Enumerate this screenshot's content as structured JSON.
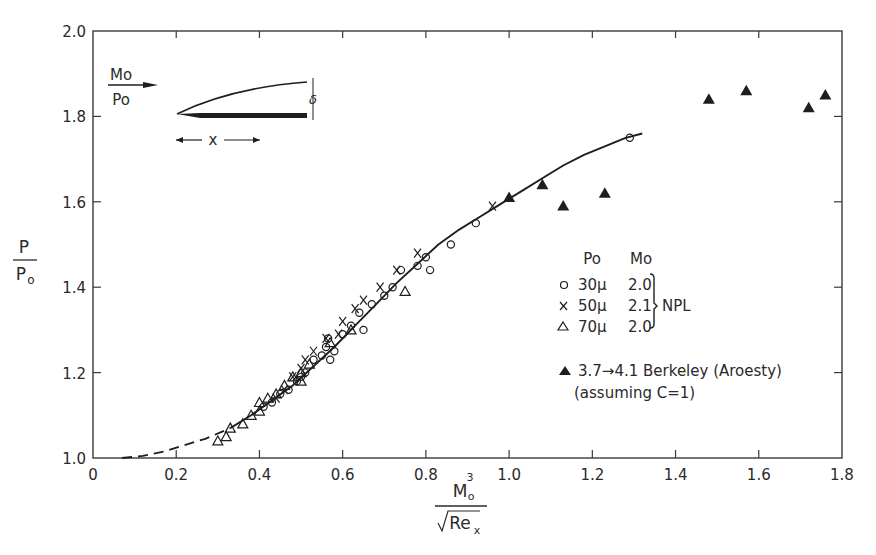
{
  "chart_data": {
    "type": "scatter",
    "title": "",
    "xlabel": "M_o^3 / sqrt(Re_x)",
    "ylabel": "P / P_o",
    "xlim": [
      0,
      1.8
    ],
    "ylim": [
      1.0,
      2.0
    ],
    "grid": false,
    "x_ticks": [
      "0",
      "0.2",
      "0.4",
      "0.6",
      "0.8",
      "1.0",
      "1.2",
      "1.4",
      "1.6",
      "1.8"
    ],
    "y_ticks": [
      "1.0",
      "1.2",
      "1.4",
      "1.6",
      "1.8",
      "2.0"
    ],
    "legend_position": "right-center inside plot",
    "legend": {
      "header_po": "Po",
      "header_mo": "Mo",
      "group_label": "NPL",
      "entries": [
        {
          "symbol": "open-circle",
          "po": "30μ",
          "mo": "2.0"
        },
        {
          "symbol": "cross",
          "po": "50μ",
          "mo": "2.1"
        },
        {
          "symbol": "open-triangle",
          "po": "70μ",
          "mo": "2.0"
        },
        {
          "symbol": "filled-triangle",
          "label": "3.7→4.1  Berkeley (Aroesty)",
          "note": "(assuming C=1)"
        }
      ]
    },
    "inset": {
      "flow_label_top": "Mo",
      "flow_label_bottom": "Po",
      "x_label": "x",
      "delta_label": "δ"
    },
    "curve": {
      "dashed": [
        [
          0.07,
          1.0
        ],
        [
          0.12,
          1.005
        ],
        [
          0.17,
          1.015
        ],
        [
          0.22,
          1.03
        ],
        [
          0.27,
          1.045
        ],
        [
          0.33,
          1.07
        ]
      ],
      "solid": [
        [
          0.33,
          1.07
        ],
        [
          0.38,
          1.1
        ],
        [
          0.43,
          1.135
        ],
        [
          0.48,
          1.17
        ],
        [
          0.53,
          1.215
        ],
        [
          0.58,
          1.26
        ],
        [
          0.63,
          1.31
        ],
        [
          0.68,
          1.36
        ],
        [
          0.73,
          1.41
        ],
        [
          0.78,
          1.455
        ],
        [
          0.83,
          1.5
        ],
        [
          0.88,
          1.535
        ],
        [
          0.93,
          1.565
        ],
        [
          0.98,
          1.595
        ],
        [
          1.03,
          1.625
        ],
        [
          1.08,
          1.655
        ],
        [
          1.13,
          1.685
        ],
        [
          1.18,
          1.71
        ],
        [
          1.23,
          1.73
        ],
        [
          1.28,
          1.75
        ],
        [
          1.32,
          1.76
        ]
      ]
    },
    "series": [
      {
        "name": "NPL 30μ, Mo 2.0",
        "symbol": "open-circle",
        "points": [
          [
            0.41,
            1.12
          ],
          [
            0.43,
            1.13
          ],
          [
            0.45,
            1.15
          ],
          [
            0.47,
            1.16
          ],
          [
            0.49,
            1.18
          ],
          [
            0.5,
            1.19
          ],
          [
            0.51,
            1.2
          ],
          [
            0.53,
            1.23
          ],
          [
            0.55,
            1.24
          ],
          [
            0.56,
            1.26
          ],
          [
            0.565,
            1.28
          ],
          [
            0.57,
            1.23
          ],
          [
            0.58,
            1.25
          ],
          [
            0.6,
            1.29
          ],
          [
            0.62,
            1.31
          ],
          [
            0.64,
            1.34
          ],
          [
            0.65,
            1.3
          ],
          [
            0.67,
            1.36
          ],
          [
            0.7,
            1.38
          ],
          [
            0.72,
            1.4
          ],
          [
            0.74,
            1.44
          ],
          [
            0.78,
            1.45
          ],
          [
            0.8,
            1.47
          ],
          [
            0.81,
            1.44
          ],
          [
            0.86,
            1.5
          ],
          [
            0.92,
            1.55
          ],
          [
            1.29,
            1.75
          ]
        ]
      },
      {
        "name": "NPL 50μ, Mo 2.1",
        "symbol": "cross",
        "points": [
          [
            0.44,
            1.14
          ],
          [
            0.46,
            1.16
          ],
          [
            0.48,
            1.19
          ],
          [
            0.5,
            1.21
          ],
          [
            0.51,
            1.23
          ],
          [
            0.53,
            1.25
          ],
          [
            0.56,
            1.28
          ],
          [
            0.59,
            1.29
          ],
          [
            0.6,
            1.32
          ],
          [
            0.63,
            1.35
          ],
          [
            0.65,
            1.37
          ],
          [
            0.69,
            1.4
          ],
          [
            0.73,
            1.44
          ],
          [
            0.78,
            1.48
          ],
          [
            0.96,
            1.59
          ]
        ]
      },
      {
        "name": "NPL 70μ, Mo 2.0",
        "symbol": "open-triangle",
        "points": [
          [
            0.3,
            1.04
          ],
          [
            0.32,
            1.05
          ],
          [
            0.33,
            1.07
          ],
          [
            0.36,
            1.08
          ],
          [
            0.38,
            1.1
          ],
          [
            0.4,
            1.11
          ],
          [
            0.4,
            1.13
          ],
          [
            0.42,
            1.14
          ],
          [
            0.44,
            1.15
          ],
          [
            0.46,
            1.17
          ],
          [
            0.48,
            1.19
          ],
          [
            0.5,
            1.18
          ],
          [
            0.5,
            1.2
          ],
          [
            0.52,
            1.22
          ],
          [
            0.57,
            1.27
          ],
          [
            0.62,
            1.3
          ],
          [
            0.75,
            1.39
          ]
        ]
      },
      {
        "name": "Berkeley (Aroesty) 3.7→4.1",
        "symbol": "filled-triangle",
        "points": [
          [
            1.0,
            1.61
          ],
          [
            1.08,
            1.64
          ],
          [
            1.13,
            1.59
          ],
          [
            1.23,
            1.62
          ],
          [
            1.48,
            1.84
          ],
          [
            1.57,
            1.86
          ],
          [
            1.72,
            1.82
          ],
          [
            1.76,
            1.85
          ]
        ]
      }
    ]
  }
}
